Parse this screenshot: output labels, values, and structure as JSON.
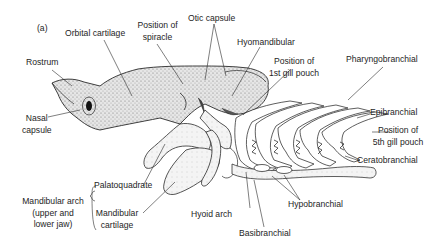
{
  "figure": {
    "panel_label": "(a)"
  },
  "labels": {
    "rostrum": "Rostrum",
    "nasal_capsule": [
      "Nasal",
      "capsule"
    ],
    "orbital_cartilage": "Orbital cartilage",
    "position_of_spiracle": [
      "Position of",
      "spiracle"
    ],
    "otic_capsule": "Otic capsule",
    "hyomandibular": "Hyomandibular",
    "position_first_gill_pouch": [
      "Position of",
      "1st gill pouch"
    ],
    "pharyngobranchial": "Pharyngobranchial",
    "epibranchial": "Epibranchial",
    "position_fifth_gill_pouch": [
      "Position of",
      "5th gill pouch"
    ],
    "ceratobranchial": "Ceratobranchial",
    "hypobranchial": "Hypobranchial",
    "basibranchial": "Basibranchial",
    "hyoid_arch": "Hyoid arch",
    "palatoquadrate": "Palatoquadrate",
    "mandibular_cartilage": [
      "Mandibular",
      "cartilage"
    ],
    "mandibular_arch": [
      "Mandibular arch",
      "(upper and",
      "lower jaw)"
    ]
  },
  "colors": {
    "outline": "#2a2a2a",
    "stipple_fill": "#d9d9d9",
    "light_fill": "#f1f1f1",
    "text": "#1e1e1e",
    "background": "#ffffff"
  }
}
